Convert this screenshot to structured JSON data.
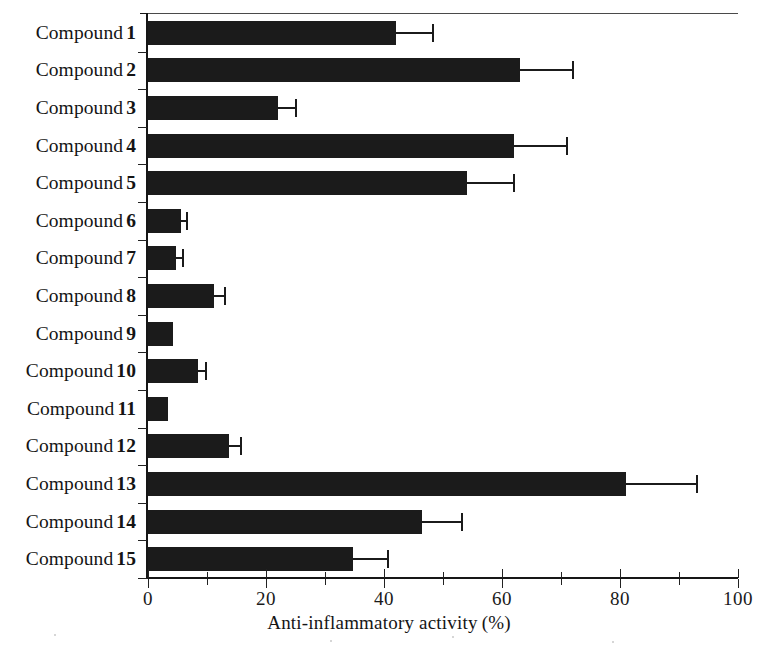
{
  "chart_data": {
    "type": "bar",
    "orientation": "horizontal",
    "title": "",
    "xlabel": "Anti-inflammatory activity (%)",
    "ylabel": "",
    "xlim": [
      0,
      100
    ],
    "xticks": [
      0,
      20,
      40,
      60,
      80,
      100
    ],
    "xticklabels": [
      "0",
      "20",
      "40",
      "60",
      "80",
      "100"
    ],
    "minor_xticks": [
      10,
      30,
      50,
      70,
      90
    ],
    "grid": false,
    "legend": false,
    "bar_color": "#1b1b1b",
    "categories": [
      "Compound 1",
      "Compound 2",
      "Compound 3",
      "Compound 4",
      "Compound 5",
      "Compound 6",
      "Compound 7",
      "Compound 8",
      "Compound 9",
      "Compound 10",
      "Compound 11",
      "Compound 12",
      "Compound 13",
      "Compound 14",
      "Compound 15"
    ],
    "category_prefix": "Compound",
    "category_numbers": [
      "1",
      "2",
      "3",
      "4",
      "5",
      "6",
      "7",
      "8",
      "9",
      "10",
      "11",
      "12",
      "13",
      "14",
      "15"
    ],
    "values": [
      42.0,
      63.0,
      22.0,
      62.0,
      54.0,
      5.6,
      4.8,
      11.2,
      4.2,
      8.5,
      3.4,
      13.7,
      81.0,
      46.5,
      34.8
    ],
    "errors": [
      6.3,
      9.0,
      3.0,
      9.0,
      8.0,
      1.0,
      1.2,
      1.8,
      0.0,
      1.3,
      0.0,
      2.0,
      12.0,
      6.8,
      5.8
    ],
    "series": [
      {
        "name": "Anti-inflammatory activity (%)",
        "values": [
          42.0,
          63.0,
          22.0,
          62.0,
          54.0,
          5.6,
          4.8,
          11.2,
          4.2,
          8.5,
          3.4,
          13.7,
          81.0,
          46.5,
          34.8
        ],
        "errors": [
          6.3,
          9.0,
          3.0,
          9.0,
          8.0,
          1.0,
          1.2,
          1.8,
          0.0,
          1.3,
          0.0,
          2.0,
          12.0,
          6.8,
          5.8
        ]
      }
    ]
  },
  "axis": {
    "x_title_main": "Anti-inflammatory activity",
    "x_title_unit": "(%)"
  }
}
